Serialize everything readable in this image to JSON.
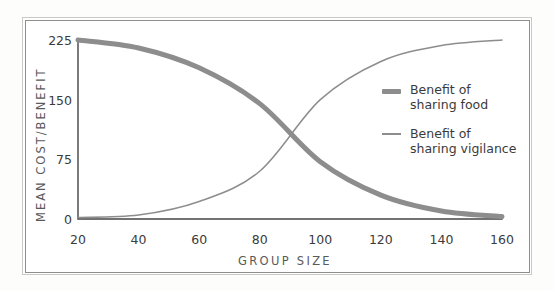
{
  "chart_data": {
    "type": "line",
    "title": "",
    "xlabel": "GROUP SIZE",
    "ylabel": "MEAN COST/BENEFIT",
    "xlim": [
      20,
      160
    ],
    "ylim": [
      0,
      225
    ],
    "grid": false,
    "legend_position": "right",
    "x_ticks": [
      "20",
      "40",
      "60",
      "80",
      "100",
      "120",
      "140",
      "160"
    ],
    "y_ticks": [
      "0",
      "75",
      "150",
      "225"
    ],
    "x": [
      20,
      40,
      60,
      80,
      100,
      120,
      140,
      160
    ],
    "series": [
      {
        "name": "Benefit of sharing food",
        "style": "thick",
        "color": "#8d8d8d",
        "values": [
          225,
          215,
          190,
          145,
          72,
          30,
          10,
          3
        ]
      },
      {
        "name": "Benefit of sharing vigilance",
        "style": "thin",
        "color": "#8d8d8d",
        "values": [
          2,
          5,
          22,
          60,
          150,
          198,
          218,
          225
        ]
      }
    ],
    "annotations": {
      "crossover_group_size": 89,
      "crossover_value": 110
    }
  },
  "legend": {
    "items": [
      {
        "label_line1": "Benefit of",
        "label_line2": "sharing food",
        "swatch": "thick-line-swatch"
      },
      {
        "label_line1": "Benefit of",
        "label_line2": "sharing vigilance",
        "swatch": "thin-line-swatch"
      }
    ]
  },
  "axes": {
    "y_title": "MEAN COST/BENEFIT",
    "x_title": "GROUP SIZE"
  },
  "colors": {
    "series": "#8d8d8d",
    "axis": "#444444",
    "frame_outer": "#c9c9c6",
    "frame_inner": "#8e8e8c",
    "text": "#3b3b3b",
    "axis_title_text": "#5a5a5a",
    "background": "#ffffff"
  }
}
